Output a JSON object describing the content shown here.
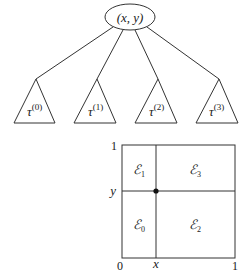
{
  "tree": {
    "root": {
      "label": "(x, y)"
    },
    "children": [
      {
        "symbol": "τ",
        "sup": "(0)"
      },
      {
        "symbol": "τ",
        "sup": "(1)"
      },
      {
        "symbol": "τ",
        "sup": "(2)"
      },
      {
        "symbol": "τ",
        "sup": "(3)"
      }
    ]
  },
  "square": {
    "axis_labels": {
      "x_min": "0",
      "x_split": "x",
      "x_max": "1",
      "y_max": "1",
      "y_split": "y"
    },
    "regions": [
      {
        "symbol": "ℰ",
        "sub": "0"
      },
      {
        "symbol": "ℰ",
        "sub": "1"
      },
      {
        "symbol": "ℰ",
        "sub": "2"
      },
      {
        "symbol": "ℰ",
        "sub": "3"
      }
    ]
  },
  "colors": {
    "line": "#333333",
    "text": "#1a1a1a",
    "background": "#ffffff"
  }
}
